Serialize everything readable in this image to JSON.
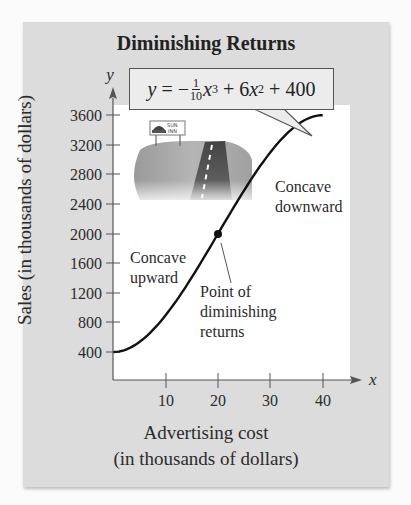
{
  "title": "Diminishing Returns",
  "equation": {
    "lhs": "y",
    "equals": "=",
    "minus": "−",
    "frac_num": "1",
    "frac_den": "10",
    "term1_var": "x",
    "term1_exp": "3",
    "plus1": "+ 6",
    "term2_var": "x",
    "term2_exp": "2",
    "plus2": "+ 400"
  },
  "annotations": {
    "concave_upward": [
      "Concave",
      "upward"
    ],
    "concave_downward": [
      "Concave",
      "downward"
    ],
    "point_label": [
      "Point of",
      "diminishing",
      "returns"
    ]
  },
  "axes": {
    "x_letter": "x",
    "y_letter": "y",
    "xlabel_line1": "Advertising cost",
    "xlabel_line2": "(in thousands of dollars)",
    "ylabel": "Sales (in thousands of dollars)"
  },
  "sign": {
    "line1": "SUN",
    "line2": "INN"
  },
  "colors": {
    "panel_bg": "#dcdcdc",
    "plot_bg": "#ffffff",
    "curve": "#111111",
    "equation_bg": "#ececec"
  },
  "chart_data": {
    "type": "line",
    "title": "Diminishing Returns",
    "function": "y = -(1/10)x^3 + 6x^2 + 400",
    "xlabel": "Advertising cost (in thousands of dollars)",
    "ylabel": "Sales (in thousands of dollars)",
    "x_ticks": [
      10,
      20,
      30,
      40
    ],
    "y_ticks": [
      400,
      800,
      1200,
      1600,
      2000,
      2400,
      2800,
      3200,
      3600
    ],
    "xlim": [
      0,
      45
    ],
    "ylim": [
      0,
      3800
    ],
    "grid": false,
    "series": [
      {
        "name": "Sales",
        "x": [
          0,
          5,
          10,
          15,
          20,
          25,
          30,
          35,
          40
        ],
        "values": [
          400,
          537.5,
          900,
          1412.5,
          2000,
          2587.5,
          3100,
          3462.5,
          3600
        ]
      }
    ],
    "inflection_point": {
      "x": 20,
      "y": 2000,
      "label": "Point of diminishing returns"
    },
    "regions": [
      {
        "label": "Concave upward",
        "x_range": [
          0,
          20
        ]
      },
      {
        "label": "Concave downward",
        "x_range": [
          20,
          40
        ]
      }
    ]
  }
}
